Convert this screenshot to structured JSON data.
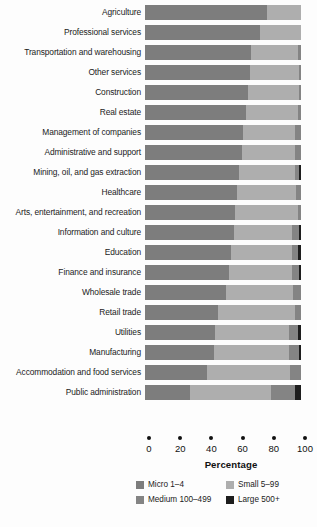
{
  "chart_data": {
    "type": "bar",
    "subtype": "stacked-horizontal-100pct",
    "title": "",
    "xlabel": "Percentage",
    "ylabel": "",
    "xlim": [
      0,
      100
    ],
    "xticks": [
      0,
      20,
      40,
      60,
      80,
      100
    ],
    "xtick_labels": [
      "0",
      "20",
      "40",
      "60",
      "80",
      "100"
    ],
    "grid": false,
    "legend_position": "bottom",
    "categories": [
      "Agriculture",
      "Professional services",
      "Transportation and warehousing",
      "Other services",
      "Construction",
      "Real estate",
      "Management of companies",
      "Administrative and support",
      "Mining, oil, and gas extraction",
      "Healthcare",
      "Arts, entertainment, and recreation",
      "Information and culture",
      "Education",
      "Finance and insurance",
      "Wholesale trade",
      "Retail trade",
      "Utilities",
      "Manufacturing",
      "Accommodation and food services",
      "Public administration"
    ],
    "series": [
      {
        "name": "Micro 1–4",
        "color": "#7d7d7d",
        "values": [
          78,
          74,
          68,
          67,
          66,
          65,
          63,
          62,
          60,
          59,
          58,
          57,
          55,
          54,
          52,
          47,
          45,
          44,
          40,
          29
        ]
      },
      {
        "name": "Small 5–99",
        "color": "#aeaeae",
        "values": [
          22,
          26,
          30,
          32,
          33,
          33,
          33,
          34,
          36,
          38,
          40,
          37,
          39,
          40,
          43,
          49,
          47,
          48,
          53,
          52
        ]
      },
      {
        "name": "Medium 100–499",
        "color": "#848484",
        "values": [
          0,
          0,
          2,
          1,
          1,
          2,
          4,
          4,
          3,
          3,
          2,
          5,
          4,
          5,
          5,
          4,
          6,
          7,
          7,
          15
        ]
      },
      {
        "name": "Large 500+",
        "color": "#1d1d1d",
        "values": [
          0,
          0,
          0,
          0,
          0,
          0,
          0,
          0,
          1,
          0,
          0,
          1,
          2,
          1,
          0,
          0,
          2,
          1,
          0,
          4
        ]
      }
    ],
    "legend": [
      {
        "label": "Micro 1–4",
        "color": "#7d7d7d"
      },
      {
        "label": "Small 5–99",
        "color": "#aeaeae"
      },
      {
        "label": "Medium 100–499",
        "color": "#848484"
      },
      {
        "label": "Large 500+",
        "color": "#1d1d1d"
      }
    ]
  }
}
